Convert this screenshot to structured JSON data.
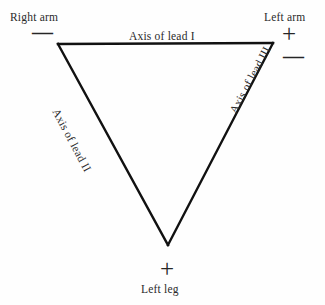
{
  "diagram": {
    "background_color": "#fefefe",
    "stroke_color": "#111111",
    "text_color": "#2a2a2a",
    "vertices": {
      "right_arm": {
        "x": 58,
        "y": 44
      },
      "left_arm": {
        "x": 273,
        "y": 43
      },
      "left_leg": {
        "x": 168,
        "y": 245
      }
    },
    "electrodes": [
      {
        "name": "right-arm",
        "label": "Right arm",
        "polarity": [
          "−"
        ]
      },
      {
        "name": "left-arm",
        "label": "Left arm",
        "polarity": [
          "+",
          "−"
        ]
      },
      {
        "name": "left-leg",
        "label": "Left leg",
        "polarity": [
          "+"
        ]
      }
    ],
    "axes": [
      {
        "name": "lead-1",
        "label": "Axis of lead I",
        "rotation_deg": 0
      },
      {
        "name": "lead-2",
        "label": "Axis of lead II",
        "rotation_deg": 62
      },
      {
        "name": "lead-3",
        "label": "Axis of lead III",
        "rotation_deg": -62
      }
    ],
    "labels": {
      "right_arm": "Right arm",
      "left_arm": "Left arm",
      "left_leg": "Left leg",
      "lead_1": "Axis of lead I",
      "lead_2": "Axis of lead II",
      "lead_3": "Axis of lead III"
    },
    "signs": {
      "right_arm_minus": "—",
      "left_arm_plus": "+",
      "left_arm_minus": "—",
      "left_leg_plus": "+"
    }
  }
}
